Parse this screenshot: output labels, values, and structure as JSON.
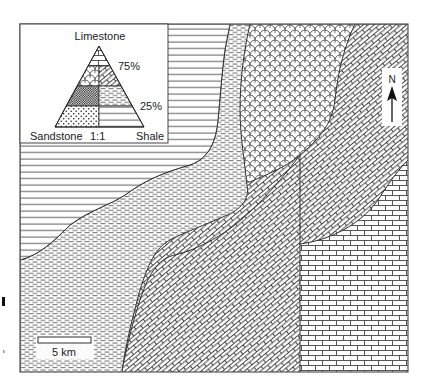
{
  "figure": {
    "type": "geologic lithofacies map",
    "legend": {
      "title": "Limestone",
      "corner_left": "Sandstone",
      "corner_right": "Shale",
      "base_ratio": "1:1",
      "level_upper": "75%",
      "level_lower": "25%",
      "fields": [
        {
          "id": "limestone",
          "pattern": "brick-horizontal"
        },
        {
          "id": "sandy-limestone",
          "pattern": "scales"
        },
        {
          "id": "shaly-limestone",
          "pattern": "brick-diagonal"
        },
        {
          "id": "calcareous-sandstone",
          "pattern": "dense-dots"
        },
        {
          "id": "calcareous-shale",
          "pattern": "dashes"
        },
        {
          "id": "sandstone",
          "pattern": "dots"
        },
        {
          "id": "shale",
          "pattern": "horizontal-lines"
        }
      ]
    },
    "north_arrow": {
      "label": "N"
    },
    "scale_bar": {
      "label": "5 km"
    },
    "map_units_west_to_east": [
      "shale",
      "calcareous-shale",
      "sandy-limestone",
      "shaly-limestone",
      "limestone"
    ],
    "colors": {
      "ink": "#333333",
      "background": "#ffffff"
    }
  }
}
